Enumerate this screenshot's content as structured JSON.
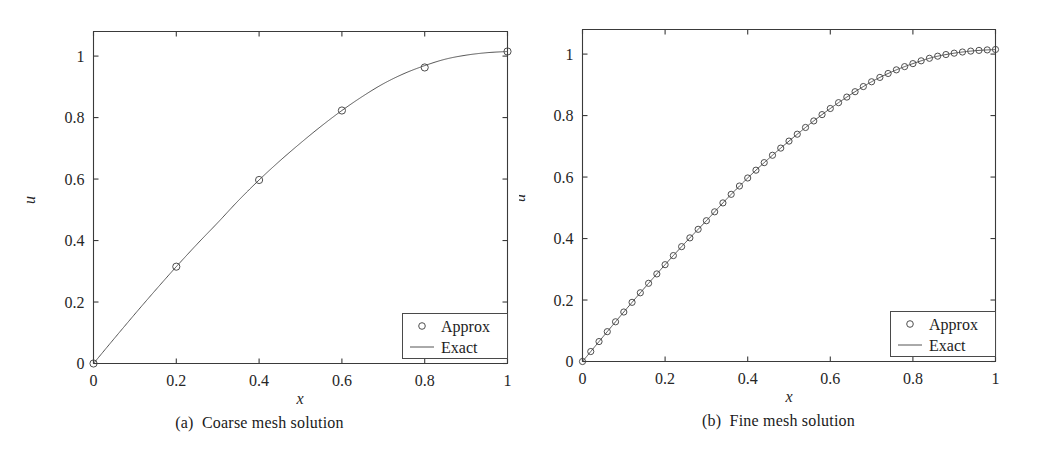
{
  "figure": {
    "panels": [
      {
        "id": "panel-a",
        "caption": "(a)  Coarse mesh solution",
        "caption_tag": "(a)",
        "caption_text": "Coarse mesh solution",
        "xlabel": "x",
        "ylabel": "u",
        "legend": {
          "approx_label": "Approx",
          "exact_label": "Exact",
          "position": "bottom-right"
        },
        "xticks": [
          "0",
          "0.2",
          "0.4",
          "0.6",
          "0.8",
          "1"
        ],
        "yticks": [
          "0",
          "0.2",
          "0.4",
          "0.6",
          "0.8",
          "1"
        ]
      },
      {
        "id": "panel-b",
        "caption": "(b)  Fine mesh solution",
        "caption_tag": "(b)",
        "caption_text": "Fine mesh solution",
        "xlabel": "x",
        "ylabel": "u",
        "legend": {
          "approx_label": "Approx",
          "exact_label": "Exact",
          "position": "bottom-right"
        },
        "xticks": [
          "0",
          "0.2",
          "0.4",
          "0.6",
          "0.8",
          "1"
        ],
        "yticks": [
          "0",
          "0.2",
          "0.4",
          "0.6",
          "0.8",
          "1"
        ]
      }
    ]
  },
  "chart_data": [
    {
      "type": "line",
      "title": "(a)  Coarse mesh solution",
      "xlabel": "x",
      "ylabel": "u",
      "xlim": [
        0,
        1
      ],
      "ylim": [
        0,
        1.08
      ],
      "xticks": [
        0,
        0.2,
        0.4,
        0.6,
        0.8,
        1
      ],
      "yticks": [
        0,
        0.2,
        0.4,
        0.6,
        0.8,
        1
      ],
      "grid": false,
      "legend": [
        "Approx",
        "Exact"
      ],
      "legend_position": "lower right",
      "series": [
        {
          "name": "Approx",
          "style": "markers",
          "marker": "circle-open",
          "x": [
            0,
            0.2,
            0.4,
            0.6,
            0.8,
            1.0
          ],
          "values": [
            0.0,
            0.315,
            0.597,
            0.823,
            0.963,
            1.015
          ]
        },
        {
          "name": "Exact",
          "style": "line",
          "x": [
            0.0,
            0.05,
            0.1,
            0.15,
            0.2,
            0.25,
            0.3,
            0.35,
            0.4,
            0.45,
            0.5,
            0.55,
            0.6,
            0.65,
            0.7,
            0.75,
            0.8,
            0.85,
            0.9,
            0.95,
            1.0
          ],
          "values": [
            0.0,
            0.081,
            0.161,
            0.239,
            0.315,
            0.388,
            0.458,
            0.53,
            0.597,
            0.659,
            0.717,
            0.772,
            0.823,
            0.869,
            0.91,
            0.943,
            0.969,
            0.99,
            1.003,
            1.011,
            1.015
          ]
        }
      ]
    },
    {
      "type": "line",
      "title": "(b)  Fine mesh solution",
      "xlabel": "x",
      "ylabel": "u",
      "xlim": [
        0,
        1
      ],
      "ylim": [
        0,
        1.08
      ],
      "xticks": [
        0,
        0.2,
        0.4,
        0.6,
        0.8,
        1
      ],
      "yticks": [
        0,
        0.2,
        0.4,
        0.6,
        0.8,
        1
      ],
      "grid": false,
      "legend": [
        "Approx",
        "Exact"
      ],
      "legend_position": "lower right",
      "n_points": 51,
      "series": [
        {
          "name": "Approx",
          "style": "markers",
          "marker": "circle-open",
          "note": "51 evenly spaced nodes from x=0 to x=1 lying on the exact curve"
        },
        {
          "name": "Exact",
          "style": "line",
          "x": [
            0.0,
            0.05,
            0.1,
            0.15,
            0.2,
            0.25,
            0.3,
            0.35,
            0.4,
            0.45,
            0.5,
            0.55,
            0.6,
            0.65,
            0.7,
            0.75,
            0.8,
            0.85,
            0.9,
            0.95,
            1.0
          ],
          "values": [
            0.0,
            0.081,
            0.161,
            0.239,
            0.315,
            0.388,
            0.458,
            0.53,
            0.597,
            0.659,
            0.717,
            0.772,
            0.823,
            0.869,
            0.91,
            0.943,
            0.969,
            0.99,
            1.003,
            1.011,
            1.015
          ]
        }
      ]
    }
  ]
}
